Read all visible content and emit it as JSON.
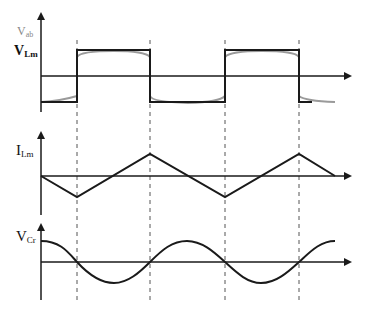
{
  "diagram": {
    "type": "waveform-timing-diagram",
    "panels": [
      {
        "id": "vab-vlm",
        "labels": [
          {
            "main": "V",
            "sub": "ab",
            "color": "#888888"
          },
          {
            "main": "V",
            "sub": "Lm",
            "color": "#111111"
          }
        ],
        "waveform": "square-wave with drooping tops (gray overlay)"
      },
      {
        "id": "ilm",
        "labels": [
          {
            "main": "I",
            "sub": "Lm",
            "color": "#111111"
          }
        ],
        "waveform": "triangular"
      },
      {
        "id": "vcr",
        "labels": [
          {
            "main": "V",
            "sub": "Cr",
            "color": "#111111"
          }
        ],
        "waveform": "sinusoidal"
      }
    ],
    "dashed_markers": 4,
    "colors": {
      "line": "#1a1a1a",
      "overlay": "#9a9a9a",
      "dashed": "#555555"
    }
  }
}
